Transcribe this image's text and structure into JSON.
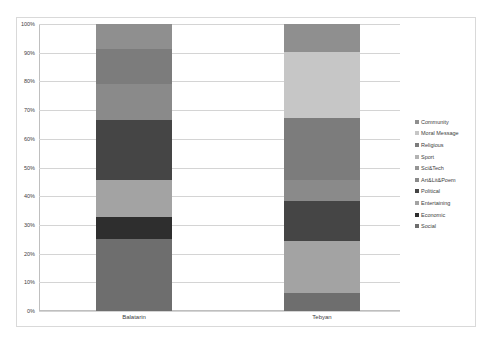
{
  "chart_data": {
    "type": "bar",
    "stacked": true,
    "normalized": true,
    "title": "",
    "xlabel": "",
    "ylabel": "",
    "ylim": [
      0,
      100
    ],
    "y_ticks": [
      "0%",
      "10%",
      "20%",
      "30%",
      "40%",
      "50%",
      "60%",
      "70%",
      "80%",
      "90%",
      "100%"
    ],
    "grid": true,
    "legend_position": "right",
    "categories": [
      "Balatarin",
      "Tebyan"
    ],
    "series": [
      {
        "name": "Social",
        "color": "#6e6e6e",
        "values": [
          25.1,
          6.2
        ]
      },
      {
        "name": "Economic",
        "color": "#2e2e2e",
        "values": [
          7.8,
          0
        ]
      },
      {
        "name": "Entertaining",
        "color": "#a3a3a3",
        "values": [
          12.7,
          18.3
        ]
      },
      {
        "name": "Political",
        "color": "#454545",
        "values": [
          21.0,
          13.8
        ]
      },
      {
        "name": "Art&Lit&Poem",
        "color": "#8a8a8a",
        "values": [
          12.5,
          7.3
        ]
      },
      {
        "name": "Sci&Tech",
        "color": "#959595",
        "values": [
          0,
          0
        ]
      },
      {
        "name": "Sport",
        "color": "#b3b3b3",
        "values": [
          0,
          0
        ]
      },
      {
        "name": "Religious",
        "color": "#7c7c7c",
        "values": [
          12.1,
          21.5
        ]
      },
      {
        "name": "Moral Message",
        "color": "#c6c6c6",
        "values": [
          0,
          23.0
        ]
      },
      {
        "name": "Community",
        "color": "#8f8f8f",
        "values": [
          8.8,
          9.9
        ]
      }
    ],
    "legend_order": [
      "Community",
      "Moral Message",
      "Religious",
      "Sport",
      "Sci&Tech",
      "Art&Lit&Poem",
      "Political",
      "Entertaining",
      "Economic",
      "Social"
    ]
  }
}
